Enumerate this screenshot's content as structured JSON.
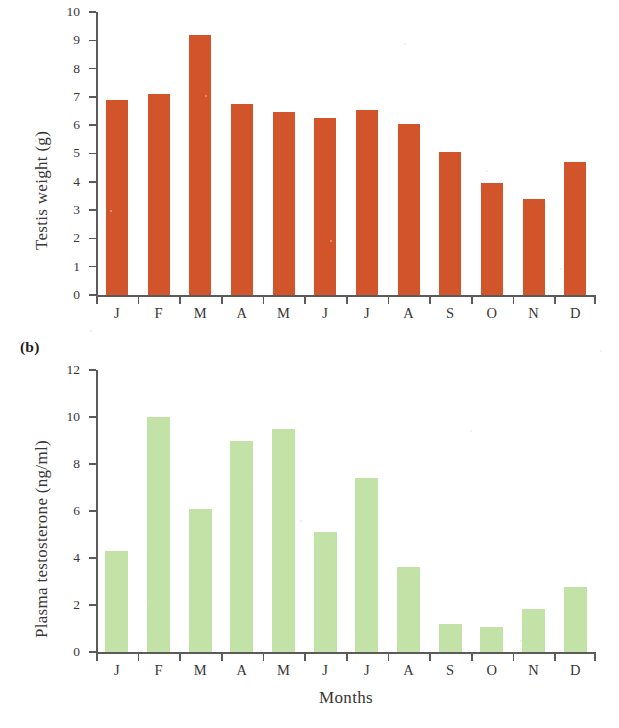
{
  "figure": {
    "panel_a_letter": "",
    "panel_b_letter": "(b)",
    "x_axis_title": "Months"
  },
  "chart_data": [
    {
      "type": "bar",
      "panel": "a",
      "title": "",
      "xlabel": "",
      "ylabel": "Testis weight (g)",
      "categories": [
        "J",
        "F",
        "M",
        "A",
        "M",
        "J",
        "J",
        "A",
        "S",
        "O",
        "N",
        "D"
      ],
      "values": [
        6.9,
        7.1,
        9.2,
        6.75,
        6.45,
        6.25,
        6.55,
        6.05,
        5.05,
        3.95,
        3.4,
        4.7
      ],
      "ylim": [
        0,
        10
      ],
      "ytick_step": 1,
      "ytick_labels": [
        "0",
        "1",
        "2",
        "3",
        "4",
        "5",
        "6",
        "7",
        "8",
        "9",
        "10"
      ],
      "bar_color": "#d2542a",
      "grid": false,
      "legend": null
    },
    {
      "type": "bar",
      "panel": "b",
      "title": "",
      "xlabel": "Months",
      "ylabel": "Plasma testosterone (ng/ml)",
      "categories": [
        "J",
        "F",
        "M",
        "A",
        "M",
        "J",
        "J",
        "A",
        "S",
        "O",
        "N",
        "D"
      ],
      "values": [
        4.3,
        10.0,
        6.1,
        9.0,
        9.5,
        5.1,
        7.4,
        3.6,
        1.2,
        1.05,
        1.85,
        2.75
      ],
      "ylim": [
        0,
        12
      ],
      "ytick_step": 2,
      "ytick_labels": [
        "0",
        "2",
        "4",
        "6",
        "8",
        "10",
        "12"
      ],
      "bar_color": "#c3e2a8",
      "grid": false,
      "legend": null
    }
  ]
}
